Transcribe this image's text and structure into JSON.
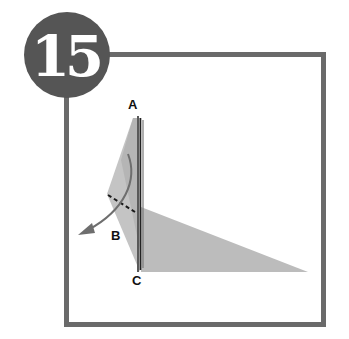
{
  "step": {
    "number": "15"
  },
  "diagram": {
    "points": {
      "a": "A",
      "b": "B",
      "c": "C"
    },
    "colors": {
      "frame": "#6a6a6a",
      "badge": "#555555",
      "paper": "#bdbdbd",
      "paper_edge": "#3a3a3a",
      "arrow": "#6e6e6e"
    }
  }
}
